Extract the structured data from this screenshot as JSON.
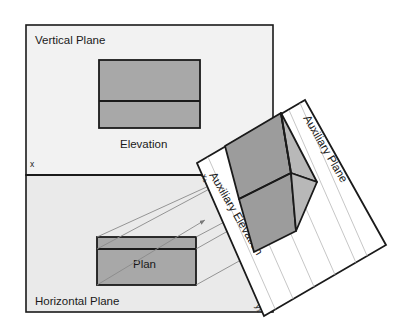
{
  "figure": {
    "title_present": false,
    "background_color": "#ffffff",
    "vertical_plane": {
      "label": "Vertical Plane",
      "fill_color": "#f2f2f2",
      "stroke_color": "#1a1a1a"
    },
    "horizontal_plane": {
      "label": "Horizontal Plane",
      "fill_color": "#eaeaea",
      "stroke_color": "#1a1a1a"
    },
    "auxiliary_plane": {
      "label": "Auxiliary Plane",
      "fill_color": "#ffffff",
      "stroke_color": "#1a1a1a"
    },
    "views": {
      "elevation": {
        "label": "Elevation",
        "fill_color": "#a8a8a8",
        "stroke_color": "#1a1a1a"
      },
      "plan": {
        "label": "Plan",
        "fill_color": "#a8a8a8",
        "stroke_color": "#1a1a1a"
      },
      "auxiliary_elevation": {
        "label": "Auxiliary Elevation",
        "fill_color_dark": "#9a9a9a",
        "fill_color_light": "#b5b5b5",
        "stroke_color": "#1a1a1a"
      }
    },
    "axes": {
      "xy_line_label": "x",
      "aux_x_label": "x₁",
      "aux_y_label": "y₁"
    },
    "projection_lines": {
      "color": "#888888",
      "count": 6,
      "has_arrowheads": true
    },
    "grid_lines": {
      "color": "#bbbbbb",
      "count": 6
    }
  }
}
